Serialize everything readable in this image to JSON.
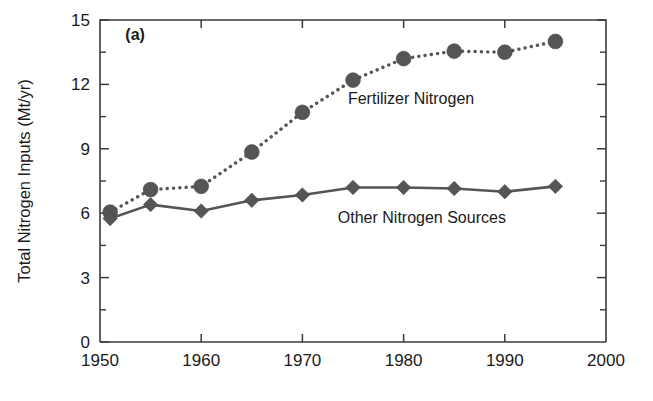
{
  "figure": {
    "panel_label": "(a)",
    "background_color": "#ffffff",
    "ink_color": "#555555",
    "axis_color": "#3a3a3a"
  },
  "chart_data": {
    "type": "line",
    "title": "",
    "subtitle": "",
    "xlabel": "",
    "ylabel": "Total Nitrogen Inputs (Mt/yr)",
    "xlim": [
      1950,
      2000
    ],
    "ylim": [
      0,
      15
    ],
    "grid": false,
    "legend_position": "inline-annotation",
    "x_ticks": [
      1950,
      1960,
      1970,
      1980,
      1990,
      2000
    ],
    "x_tick_labels": [
      "1950",
      "1960",
      "1970",
      "1980",
      "1990",
      "2000"
    ],
    "x_minor_ticks": [
      1955,
      1965,
      1975,
      1985,
      1995
    ],
    "y_ticks": [
      0,
      3,
      6,
      9,
      12,
      15
    ],
    "y_tick_labels": [
      "0",
      "3",
      "6",
      "9",
      "12",
      "15"
    ],
    "y_minor_ticks": [
      1.5,
      4.5,
      7.5,
      10.5,
      13.5
    ],
    "series": [
      {
        "name": "Fertilizer Nitrogen",
        "marker": "circle",
        "linestyle": "dotted",
        "color": "#555555",
        "annotation": "Fertilizer Nitrogen",
        "x": [
          1951,
          1955,
          1960,
          1965,
          1970,
          1975,
          1980,
          1985,
          1990,
          1995
        ],
        "values": [
          6.05,
          7.1,
          7.25,
          8.85,
          10.7,
          12.2,
          13.2,
          13.55,
          13.5,
          14.0
        ]
      },
      {
        "name": "Other Nitrogen Sources",
        "marker": "diamond",
        "linestyle": "solid",
        "color": "#555555",
        "annotation": "Other Nitrogen Sources",
        "x": [
          1951,
          1955,
          1960,
          1965,
          1970,
          1975,
          1980,
          1985,
          1990,
          1995
        ],
        "values": [
          5.75,
          6.4,
          6.1,
          6.6,
          6.85,
          7.2,
          7.2,
          7.15,
          7.0,
          7.25
        ]
      }
    ],
    "annotations": [
      {
        "text": "Fertilizer Nitrogen",
        "x": 1974.5,
        "y": 11.1
      },
      {
        "text": "Other Nitrogen Sources",
        "x": 1973.5,
        "y": 5.55
      },
      {
        "text": "(a)",
        "x": 1952.5,
        "y": 14.05
      }
    ]
  }
}
